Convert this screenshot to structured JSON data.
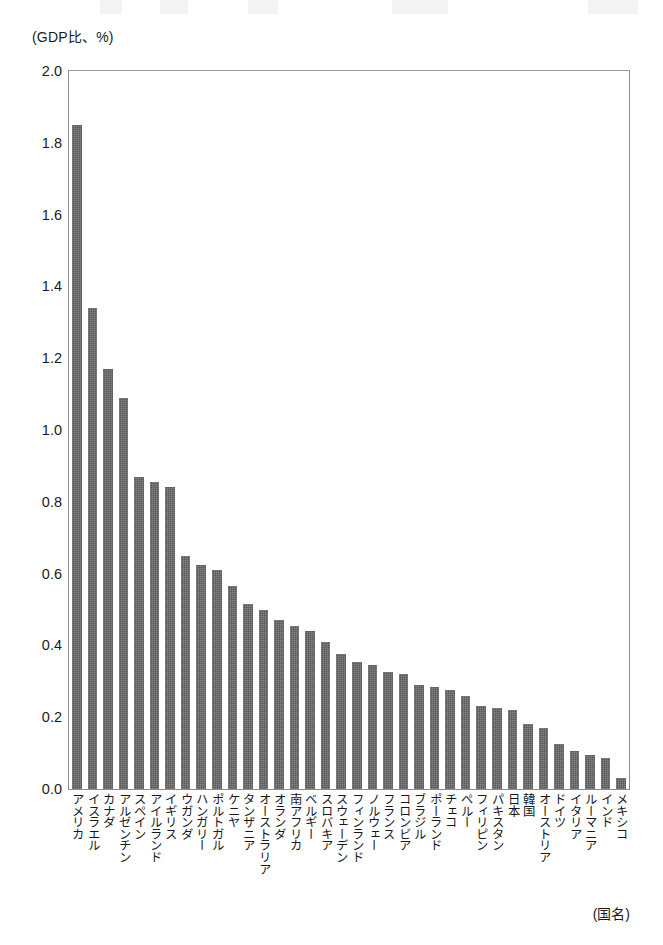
{
  "chart_data": {
    "type": "bar",
    "title": "",
    "subtitle": "",
    "xlabel": "(国名)",
    "ylabel": "(GDP比、%)",
    "ylim": [
      0.0,
      2.0
    ],
    "ytick_labels": [
      "2.0",
      "1.8",
      "1.6",
      "1.4",
      "1.2",
      "1.0",
      "0.8",
      "0.6",
      "0.4",
      "0.2",
      "0.0"
    ],
    "ytick_values": [
      2.0,
      1.8,
      1.6,
      1.4,
      1.2,
      1.0,
      0.8,
      0.6,
      0.4,
      0.2,
      0.0
    ],
    "grid": false,
    "legend": null,
    "bar_color": "#595959",
    "axis_color": "#8d8d8d",
    "categories": [
      "アメリカ",
      "イスラエル",
      "カナダ",
      "アルゼンチン",
      "スペイン",
      "アイルランド",
      "イギリス",
      "ウガンダ",
      "ハンガリー",
      "ポルトガル",
      "ケニヤ",
      "タンザニア",
      "オーストラリア",
      "オランダ",
      "南アフリカ",
      "ベルギー",
      "スロバキア",
      "スウェーデン",
      "フィンランド",
      "ノルウェー",
      "フランス",
      "コロンビア",
      "ブラジル",
      "ポーランド",
      "チェコ",
      "ペルー",
      "フィリピン",
      "パキスタン",
      "日本",
      "韓国",
      "オーストリア",
      "ドイツ",
      "イタリア",
      "ルーマニア",
      "インド",
      "メキシコ"
    ],
    "values": [
      1.85,
      1.34,
      1.17,
      1.09,
      0.87,
      0.855,
      0.84,
      0.65,
      0.625,
      0.61,
      0.565,
      0.515,
      0.5,
      0.47,
      0.455,
      0.44,
      0.41,
      0.375,
      0.355,
      0.345,
      0.325,
      0.32,
      0.29,
      0.285,
      0.275,
      0.26,
      0.23,
      0.225,
      0.22,
      0.18,
      0.17,
      0.125,
      0.105,
      0.095,
      0.085,
      0.03
    ]
  }
}
